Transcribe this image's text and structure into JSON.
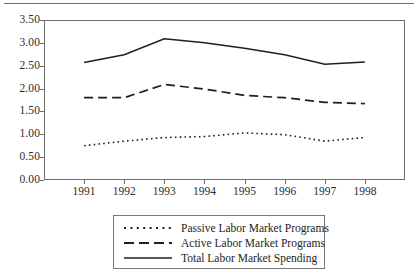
{
  "chart_data": {
    "type": "line",
    "title": "",
    "xlabel": "",
    "ylabel": "",
    "categories": [
      "1991",
      "1992",
      "1993",
      "1994",
      "1995",
      "1996",
      "1997",
      "1998"
    ],
    "x": [
      1991,
      1992,
      1993,
      1994,
      1995,
      1996,
      1997,
      1998
    ],
    "xlim": [
      1990.5,
      1998.5
    ],
    "ylim": [
      0.0,
      3.5
    ],
    "yticks": [
      "0.00",
      "0.50",
      "1.00",
      "1.50",
      "2.00",
      "2.50",
      "3.00",
      "3.50"
    ],
    "ytick_values": [
      0.0,
      0.5,
      1.0,
      1.5,
      2.0,
      2.5,
      3.0,
      3.5
    ],
    "grid": false,
    "legend_position": "bottom",
    "series": [
      {
        "name": "Passive Labor Market Programs",
        "style": "dotted",
        "color": "#1f1f1f",
        "values": [
          0.75,
          0.85,
          0.93,
          0.95,
          1.03,
          0.99,
          0.85,
          0.93
        ]
      },
      {
        "name": "Active Labor Market Programs",
        "style": "dashed",
        "color": "#1f1f1f",
        "values": [
          1.8,
          1.8,
          2.09,
          1.99,
          1.85,
          1.8,
          1.7,
          1.67
        ]
      },
      {
        "name": "Total Labor Market Spending",
        "style": "solid",
        "color": "#1f1f1f",
        "values": [
          2.57,
          2.74,
          3.09,
          3.0,
          2.88,
          2.74,
          2.53,
          2.58
        ]
      }
    ]
  },
  "axes": {
    "y_tick_labels": [
      "3.50",
      "3.00",
      "2.50",
      "2.00",
      "1.50",
      "1.00",
      "0.50",
      "0.00"
    ],
    "x_tick_labels": [
      "1991",
      "1992",
      "1993",
      "1994",
      "1995",
      "1996",
      "1997",
      "1998"
    ]
  },
  "legend": {
    "entries": [
      {
        "label": "Passive Labor Market Programs",
        "style": "dotted"
      },
      {
        "label": "Active Labor Market Programs",
        "style": "dashed"
      },
      {
        "label": "Total Labor Market Spending",
        "style": "solid"
      }
    ]
  }
}
